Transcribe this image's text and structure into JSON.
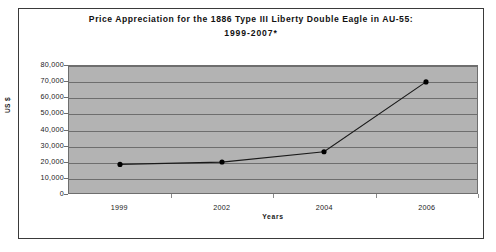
{
  "chart_data": {
    "type": "line",
    "title": "Price Appreciation for the 1886 Type III Liberty Double Eagle in AU-55:",
    "subtitle": "1999-2007*",
    "xlabel": "Years",
    "ylabel": "US $",
    "categories": [
      "1999",
      "2002",
      "2004",
      "2006"
    ],
    "values": [
      18000,
      19500,
      26000,
      70000
    ],
    "series": [
      {
        "name": "Price",
        "values": [
          18000,
          19500,
          26000,
          70000
        ]
      }
    ],
    "ylim": [
      0,
      80000
    ],
    "ytick_labels": [
      "80,000",
      "70,000",
      "60,000",
      "50,000",
      "40,000",
      "30,000",
      "20,000",
      "10,000",
      "0"
    ],
    "ytick_values": [
      80000,
      70000,
      60000,
      50000,
      40000,
      30000,
      20000,
      10000,
      0
    ],
    "grid": "horizontal",
    "legend": "none",
    "plot_background_color": "#b3b3b3",
    "gridline_color": "#6e6e6e",
    "line_color": "#1a1a1a",
    "marker_color": "#000000",
    "marker_shape": "circle"
  }
}
